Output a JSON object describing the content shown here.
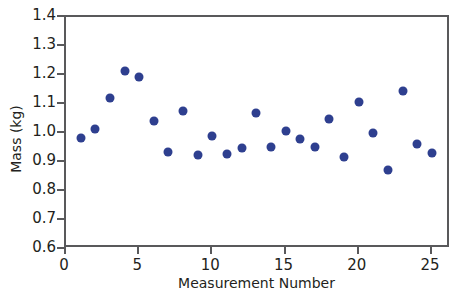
{
  "chart_data": {
    "type": "scatter",
    "title": "",
    "xlabel": "Measurement Number",
    "ylabel": "Mass (kg)",
    "xlim": [
      0,
      26.3
    ],
    "ylim": [
      0.6,
      1.4
    ],
    "grid": false,
    "legend": false,
    "marker_color": "#2e3f8f",
    "axis_color": "#59595b",
    "text_color": "#231f20",
    "xticks": [
      "0",
      "5",
      "10",
      "15",
      "20",
      "25"
    ],
    "xtick_values": [
      0,
      5,
      10,
      15,
      20,
      25
    ],
    "yticks": [
      "0.6",
      "0.7",
      "0.8",
      "0.9",
      "1.0",
      "1.1",
      "1.2",
      "1.3",
      "1.4"
    ],
    "ytick_values": [
      0.6,
      0.7,
      0.8,
      0.9,
      1.0,
      1.1,
      1.2,
      1.3,
      1.4
    ],
    "x": [
      1,
      2,
      3,
      4,
      5,
      6,
      7,
      8,
      9,
      10,
      11,
      12,
      13,
      14,
      15,
      16,
      17,
      18,
      19,
      20,
      21,
      22,
      23,
      24,
      25
    ],
    "y": [
      0.983,
      1.014,
      1.119,
      1.213,
      1.194,
      1.041,
      0.934,
      1.076,
      0.925,
      0.99,
      0.926,
      0.949,
      1.068,
      0.953,
      1.008,
      0.978,
      0.952,
      1.047,
      0.917,
      1.108,
      1.001,
      0.874,
      1.145,
      0.961,
      0.93
    ]
  }
}
